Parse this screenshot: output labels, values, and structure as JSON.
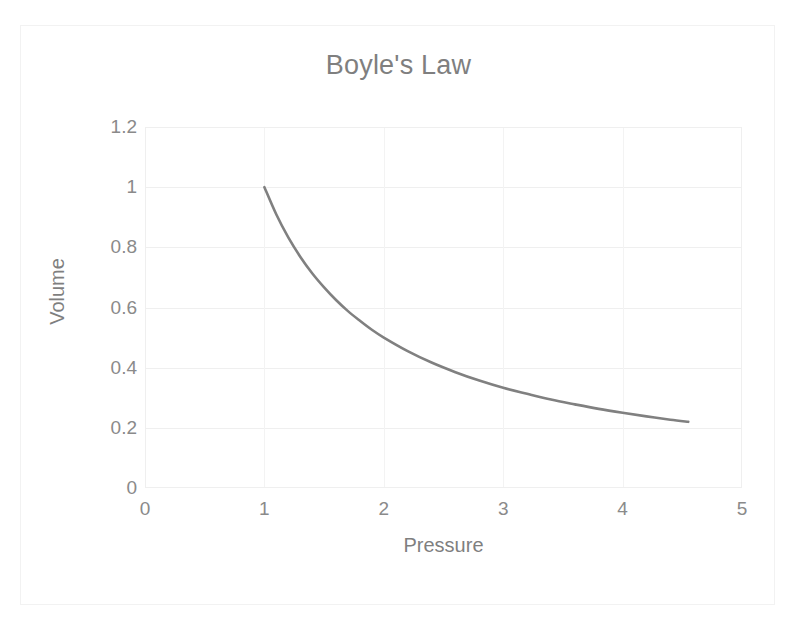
{
  "chart_data": {
    "type": "line",
    "title": "Boyle's Law",
    "xlabel": "Pressure",
    "ylabel": "Volume",
    "xlim": [
      0,
      5
    ],
    "ylim": [
      0,
      1.2
    ],
    "xticks": [
      "0",
      "1",
      "2",
      "3",
      "4",
      "5"
    ],
    "yticks": [
      "0",
      "0.2",
      "0.4",
      "0.6",
      "0.8",
      "1",
      "1.2"
    ],
    "grid": true,
    "legend": "none",
    "series": [
      {
        "name": "Volume",
        "color": "#808080",
        "x": [
          1.0,
          1.1,
          1.2,
          1.3,
          1.4,
          1.5,
          1.6,
          1.7,
          1.8,
          1.9,
          2.0,
          2.2,
          2.4,
          2.6,
          2.8,
          3.0,
          3.2,
          3.4,
          3.6,
          3.8,
          4.0,
          4.2,
          4.4,
          4.55
        ],
        "y": [
          1.0,
          0.909,
          0.833,
          0.769,
          0.714,
          0.667,
          0.625,
          0.588,
          0.556,
          0.526,
          0.5,
          0.455,
          0.417,
          0.385,
          0.357,
          0.333,
          0.313,
          0.294,
          0.278,
          0.263,
          0.25,
          0.238,
          0.227,
          0.22
        ]
      }
    ]
  },
  "colors": {
    "series": "#808080",
    "text": "#7f7f7f",
    "tick_text": "#8a8a8a",
    "gridline": "#efefef",
    "plot_border": "#efefef",
    "frame_border": "#f2f2f2",
    "background": "#ffffff"
  }
}
